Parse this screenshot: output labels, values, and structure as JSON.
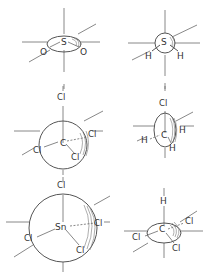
{
  "figure": {
    "molecules": [
      {
        "id": "so2",
        "center_atom": "S",
        "ligands": [
          "O",
          "O"
        ],
        "shape": "ellipse-flat"
      },
      {
        "id": "h2s",
        "center_atom": "S",
        "ligands": [
          "H",
          "H"
        ],
        "shape": "circle-small"
      },
      {
        "id": "ccl4",
        "center_atom": "C",
        "ligands": [
          "Cl",
          "Cl",
          "Cl",
          "Cl"
        ],
        "shape": "circle"
      },
      {
        "id": "ch3cl",
        "center_atom": "C",
        "ligands": [
          "Cl",
          "H",
          "H",
          "H"
        ],
        "shape": "ellipse-tall"
      },
      {
        "id": "sncl4",
        "center_atom": "Sn",
        "ligands": [
          "Cl",
          "Cl",
          "Cl",
          "Cl"
        ],
        "shape": "circle-large"
      },
      {
        "id": "chcl3",
        "center_atom": "C",
        "ligands": [
          "H",
          "Cl",
          "Cl",
          "Cl"
        ],
        "shape": "ellipse-wide"
      }
    ]
  },
  "labels": {
    "so2": {
      "center": "S",
      "left": "O",
      "right": "O"
    },
    "h2s": {
      "center": "S",
      "left": "H",
      "right": "H"
    },
    "ccl4": {
      "center": "C",
      "top": "Cl",
      "left": "Cl",
      "right": "Cl",
      "bottom": "Cl"
    },
    "ch3cl": {
      "center": "C",
      "top": "Cl",
      "left": "H",
      "right": "H",
      "bottom": "H"
    },
    "sncl4": {
      "center": "Sn",
      "top": "Cl",
      "left": "Cl",
      "right": "Cl",
      "bottom": "Cl"
    },
    "chcl3": {
      "center": "C",
      "top": "H",
      "left": "Cl",
      "right": "Cl",
      "bottom": "Cl"
    }
  },
  "colors": {
    "background": "#ffffff",
    "line": "#6a6a6a",
    "text": "#333333"
  }
}
